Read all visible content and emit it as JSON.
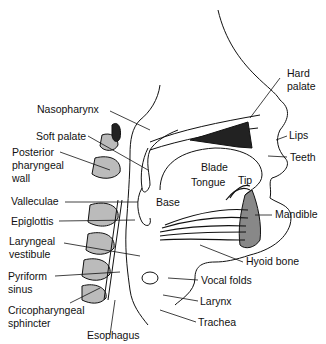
{
  "diagram": {
    "labels": {
      "nasopharynx": "Nasopharynx",
      "soft_palate": "Soft palate",
      "posterior_pharyngeal_wall_1": "Posterior",
      "posterior_pharyngeal_wall_2": "pharyngeal",
      "posterior_pharyngeal_wall_3": "wall",
      "valleculae": "Valleculae",
      "epiglottis": "Epiglottis",
      "laryngeal_vestibule_1": "Laryngeal",
      "laryngeal_vestibule_2": "vestibule",
      "pyriform_sinus_1": "Pyriform",
      "pyriform_sinus_2": "sinus",
      "cricopharyngeal_sphincter_1": "Cricopharyngeal",
      "cricopharyngeal_sphincter_2": "sphincter",
      "esophagus": "Esophagus",
      "hard_palate_1": "Hard",
      "hard_palate_2": "palate",
      "lips": "Lips",
      "teeth": "Teeth",
      "blade": "Blade",
      "tongue": "Tongue",
      "tip": "Tip",
      "base": "Base",
      "mandible": "Mandible",
      "hyoid_bone": "Hyoid bone",
      "vocal_folds": "Vocal folds",
      "larynx": "Larynx",
      "trachea": "Trachea"
    }
  }
}
